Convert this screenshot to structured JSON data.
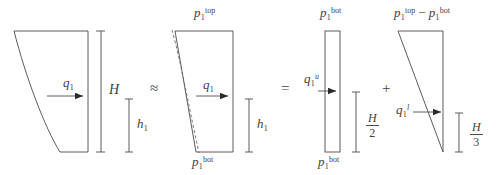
{
  "figure": {
    "type": "engineering-diagram",
    "panels": [
      {
        "id": "panel-exact",
        "name": "exact-curved-pressure",
        "shape": "curved-wedge",
        "load_label": "q",
        "load_sub": "1",
        "load_sup": "",
        "dimensions": [
          {
            "name": "total-height",
            "symbol": "H",
            "kind": "plain"
          },
          {
            "name": "resultant-arm",
            "symbol": "h",
            "sub": "1",
            "kind": "subscript"
          }
        ]
      },
      {
        "id": "panel-trapezoid",
        "name": "linearized-trapezoid-pressure",
        "shape": "trapezoid-with-dashed-curve",
        "top_label": {
          "base": "p",
          "sub": "1",
          "sup": "top"
        },
        "bottom_label": {
          "base": "p",
          "sub": "1",
          "sup": "bot"
        },
        "load_label": "q",
        "load_sub": "1",
        "dimensions": [
          {
            "name": "resultant-arm",
            "symbol": "h",
            "sub": "1",
            "kind": "subscript"
          }
        ]
      },
      {
        "id": "panel-rectangle",
        "name": "uniform-rectangular-component",
        "shape": "rectangle",
        "top_label": {
          "base": "p",
          "sub": "1",
          "sup": "bot"
        },
        "bottom_label": {
          "base": "p",
          "sub": "1",
          "sup": "bot"
        },
        "load_label": {
          "base": "q",
          "sub": "1",
          "sup": "u"
        },
        "dimensions": [
          {
            "name": "rect-resultant-arm",
            "numerator": "H",
            "denominator": "2"
          }
        ]
      },
      {
        "id": "panel-triangle",
        "name": "triangular-component",
        "shape": "triangle",
        "top_label": {
          "base": "p",
          "sub": "1",
          "sup": "top",
          "minus": "−",
          "base2": "p",
          "sub2": "1",
          "sup2": "bot"
        },
        "load_label": {
          "base": "q",
          "sub": "1",
          "sup": "l"
        },
        "dimensions": [
          {
            "name": "tri-resultant-arm",
            "numerator": "H",
            "denominator": "3"
          }
        ]
      }
    ],
    "operators": [
      {
        "name": "approx-equals",
        "glyph": "≈"
      },
      {
        "name": "equals",
        "glyph": "="
      },
      {
        "name": "plus",
        "glyph": "+"
      }
    ],
    "labels": {
      "q1": "q",
      "p": "p",
      "H": "H",
      "h": "h",
      "one": "1",
      "two": "2",
      "three": "3",
      "top": "top",
      "bot": "bot",
      "u": "u",
      "l": "l",
      "minus": "−"
    },
    "colors": {
      "stroke": "#4a4a4a",
      "text": "#3f3f3f",
      "background": "#ffffff",
      "arrow_fill": "#2a2a2a"
    }
  }
}
